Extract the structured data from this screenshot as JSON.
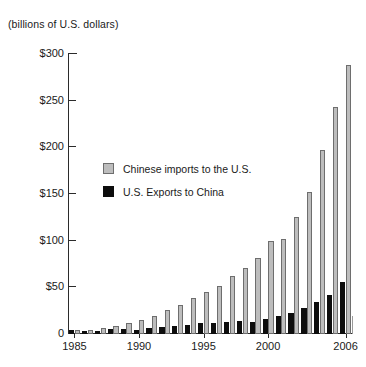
{
  "chart_data": {
    "type": "bar",
    "title": "",
    "subtitle": "(billions of U.S. dollars)",
    "xlabel": "",
    "ylabel": "",
    "ylim": [
      0,
      300
    ],
    "grid": false,
    "legend_position": "inside-left",
    "y_ticks": [
      0,
      50,
      100,
      150,
      200,
      250,
      300
    ],
    "y_tick_labels": [
      "0",
      "$50",
      "$100",
      "$150",
      "$200",
      "$250",
      "$300"
    ],
    "x_tick_labels": [
      "1985",
      "1990",
      "1995",
      "2000",
      "2006"
    ],
    "x_tick_years": [
      1985,
      1990,
      1995,
      2000,
      2006
    ],
    "categories": [
      1985,
      1986,
      1987,
      1988,
      1989,
      1990,
      1991,
      1992,
      1993,
      1994,
      1995,
      1996,
      1997,
      1998,
      1999,
      2000,
      2001,
      2002,
      2003,
      2004,
      2005,
      2006
    ],
    "series": [
      {
        "name": "Chinese imports to the U.S.",
        "color": "#bdbdbd",
        "values": [
          3.9,
          4.8,
          6.3,
          8.5,
          12.0,
          15.2,
          19.0,
          25.7,
          31.5,
          38.8,
          45.5,
          51.5,
          62.6,
          71.2,
          81.8,
          100.0,
          102.3,
          125.2,
          152.4,
          196.7,
          243.5,
          287.8
        ]
      },
      {
        "name": "U.S. Exports to China",
        "color": "#0d0d0d",
        "values": [
          3.9,
          3.1,
          3.5,
          5.0,
          5.8,
          4.8,
          6.3,
          7.5,
          8.8,
          9.3,
          11.8,
          12.0,
          12.9,
          14.3,
          13.1,
          16.2,
          19.2,
          22.1,
          28.4,
          34.7,
          41.8,
          55.2
        ]
      }
    ]
  },
  "legend": {
    "items": [
      {
        "label": "Chinese imports to the U.S.",
        "swatch": "imports"
      },
      {
        "label": "U.S. Exports to China",
        "swatch": "exports"
      }
    ]
  }
}
